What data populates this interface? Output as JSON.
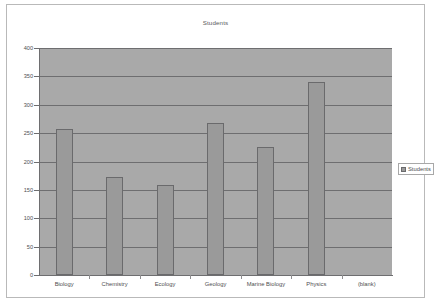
{
  "chart_data": {
    "type": "bar",
    "title": "Students",
    "xlabel": "",
    "ylabel": "",
    "categories": [
      "Biology",
      "Chemistry",
      "Ecology",
      "Geology",
      "Marine Biology",
      "Physics",
      "(blank)"
    ],
    "values": [
      258,
      172,
      158,
      268,
      225,
      340,
      null
    ],
    "series": [
      {
        "name": "Students",
        "values": [
          258,
          172,
          158,
          268,
          225,
          340,
          null
        ]
      }
    ],
    "ylim": [
      0,
      400
    ],
    "yticks": [
      0,
      50,
      100,
      150,
      200,
      250,
      300,
      350,
      400
    ],
    "ytick_labels": [
      "0",
      "50",
      "100",
      "150",
      "200",
      "250",
      "300",
      "350",
      "400"
    ],
    "grid": true,
    "legend": [
      "Students"
    ],
    "legend_position": "right"
  },
  "legend": {
    "entry_label": "Students",
    "swatch_color": "#9a9a9a"
  },
  "colors": {
    "plot_background": "#a9a9a9",
    "bar_fill": "#9a9a9a",
    "bar_border": "#6a6a6c",
    "gridline": "#6e6e70",
    "text": "#4e4e50",
    "frame_border": "#b9b9b9",
    "page_background": "#ffffff"
  }
}
